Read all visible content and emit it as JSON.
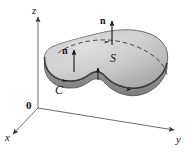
{
  "figure": {
    "background_color": "#ffffff",
    "axes": {
      "origin_label": "0",
      "z_label": "z",
      "x_label": "x",
      "y_label": "y",
      "axis_color": "#555555"
    },
    "labels": {
      "normal_top": "n",
      "normal_left": "n",
      "surface": "S",
      "curve": "C"
    },
    "colors": {
      "surface_fill_light": "#d2d2d2",
      "surface_fill_mid": "#b8b8b8",
      "surface_fill_dark": "#8f8f8f",
      "surface_edge": "#4a4a4a",
      "dashed_curve": "#3a3a3a",
      "arrow": "#1a1a1a"
    },
    "elements": {
      "dashed_curve_name": "hidden-back-edge",
      "orientation_arrow_on_curve": "counterclockwise",
      "normal_arrow_count": 2
    }
  }
}
